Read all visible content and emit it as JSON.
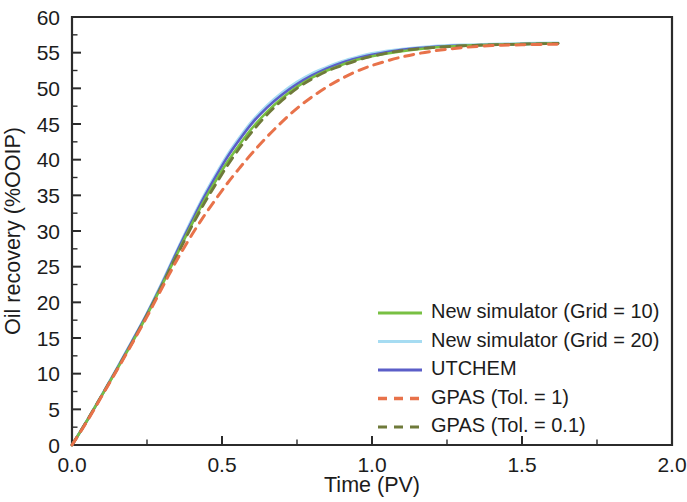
{
  "chart_data": {
    "type": "line",
    "title": "",
    "xlabel": "Time (PV)",
    "ylabel": "Oil recovery (%OOIP)",
    "xlim": [
      0.0,
      2.0
    ],
    "ylim": [
      0,
      60
    ],
    "xticks": [
      "0.0",
      "0.5",
      "1.0",
      "1.5",
      "2.0"
    ],
    "xtick_values": [
      0.0,
      0.5,
      1.0,
      1.5,
      2.0
    ],
    "xminor_step": 0.25,
    "yticks": [
      "0",
      "5",
      "10",
      "15",
      "20",
      "25",
      "30",
      "35",
      "40",
      "45",
      "50",
      "55",
      "60"
    ],
    "ytick_values": [
      0,
      5,
      10,
      15,
      20,
      25,
      30,
      35,
      40,
      45,
      50,
      55,
      60
    ],
    "yminor_step": 2.5,
    "grid": false,
    "legend_position": "lower right inside",
    "series": [
      {
        "name": "New simulator (Grid = 10)",
        "color": "#78c043",
        "style": "solid",
        "width": 2.6,
        "x": [
          0.0,
          0.05,
          0.1,
          0.15,
          0.2,
          0.25,
          0.3,
          0.33,
          0.36,
          0.4,
          0.44,
          0.48,
          0.52,
          0.56,
          0.6,
          0.65,
          0.7,
          0.75,
          0.8,
          0.85,
          0.9,
          0.95,
          1.0,
          1.1,
          1.2,
          1.3,
          1.4,
          1.5,
          1.62
        ],
        "y": [
          0.0,
          3.4,
          7.0,
          10.6,
          14.3,
          18.2,
          22.4,
          25.0,
          27.6,
          31.0,
          34.2,
          37.1,
          39.8,
          42.2,
          44.4,
          46.7,
          48.6,
          50.2,
          51.5,
          52.5,
          53.3,
          54.0,
          54.5,
          55.2,
          55.7,
          55.95,
          56.1,
          56.2,
          56.3
        ]
      },
      {
        "name": "New simulator (Grid = 20)",
        "color": "#a6dcf2",
        "style": "solid",
        "width": 2.6,
        "x": [
          0.0,
          0.05,
          0.1,
          0.15,
          0.2,
          0.25,
          0.3,
          0.33,
          0.36,
          0.4,
          0.44,
          0.48,
          0.52,
          0.56,
          0.6,
          0.65,
          0.7,
          0.75,
          0.8,
          0.85,
          0.9,
          0.95,
          1.0,
          1.1,
          1.2,
          1.3,
          1.4,
          1.5,
          1.62
        ],
        "y": [
          0.0,
          3.45,
          7.1,
          10.8,
          14.6,
          18.5,
          22.8,
          25.5,
          28.2,
          31.7,
          35.0,
          38.0,
          40.8,
          43.2,
          45.4,
          47.6,
          49.4,
          50.9,
          52.1,
          53.0,
          53.8,
          54.4,
          54.9,
          55.5,
          55.9,
          56.1,
          56.2,
          56.3,
          56.4
        ]
      },
      {
        "name": "UTCHEM",
        "color": "#5b5ec8",
        "style": "solid",
        "width": 2.6,
        "x": [
          0.0,
          0.05,
          0.1,
          0.15,
          0.2,
          0.25,
          0.3,
          0.33,
          0.36,
          0.4,
          0.44,
          0.48,
          0.52,
          0.56,
          0.6,
          0.65,
          0.7,
          0.75,
          0.8,
          0.85,
          0.9,
          0.95,
          1.0,
          1.1,
          1.2,
          1.3,
          1.4,
          1.5,
          1.62
        ],
        "y": [
          0.0,
          3.4,
          7.0,
          10.7,
          14.5,
          18.4,
          22.6,
          25.3,
          28.0,
          31.4,
          34.7,
          37.7,
          40.5,
          42.9,
          45.1,
          47.3,
          49.1,
          50.6,
          51.8,
          52.8,
          53.6,
          54.2,
          54.7,
          55.4,
          55.8,
          56.0,
          56.1,
          56.2,
          56.3
        ]
      },
      {
        "name": "GPAS (Tol. = 1)",
        "color": "#e8724a",
        "style": "dashed",
        "width": 3.0,
        "x": [
          0.0,
          0.05,
          0.1,
          0.15,
          0.2,
          0.25,
          0.3,
          0.33,
          0.36,
          0.4,
          0.44,
          0.48,
          0.52,
          0.56,
          0.6,
          0.65,
          0.7,
          0.75,
          0.8,
          0.85,
          0.9,
          0.95,
          1.0,
          1.1,
          1.2,
          1.3,
          1.4,
          1.5,
          1.62
        ],
        "y": [
          0.0,
          3.3,
          6.9,
          10.5,
          14.2,
          18.0,
          22.0,
          24.4,
          26.7,
          29.5,
          32.1,
          34.5,
          36.8,
          38.9,
          40.9,
          43.2,
          45.3,
          47.2,
          48.8,
          50.2,
          51.4,
          52.4,
          53.2,
          54.4,
          55.2,
          55.7,
          56.0,
          56.1,
          56.2
        ]
      },
      {
        "name": "GPAS (Tol. = 0.1)",
        "color": "#6f7a3a",
        "style": "dashed",
        "width": 2.8,
        "x": [
          0.0,
          0.05,
          0.1,
          0.15,
          0.2,
          0.25,
          0.3,
          0.33,
          0.36,
          0.4,
          0.44,
          0.48,
          0.52,
          0.56,
          0.6,
          0.65,
          0.7,
          0.75,
          0.8,
          0.85,
          0.9,
          0.95,
          1.0,
          1.1,
          1.2,
          1.3,
          1.4,
          1.5,
          1.62
        ],
        "y": [
          0.0,
          3.4,
          7.0,
          10.6,
          14.3,
          18.2,
          22.3,
          24.9,
          27.4,
          30.7,
          33.8,
          36.6,
          39.3,
          41.7,
          43.9,
          46.3,
          48.3,
          50.0,
          51.3,
          52.4,
          53.2,
          53.9,
          54.5,
          55.3,
          55.7,
          55.95,
          56.1,
          56.2,
          56.3
        ]
      }
    ]
  },
  "legend": {
    "items": [
      {
        "label": "New simulator (Grid = 10)"
      },
      {
        "label": "New simulator (Grid = 20)"
      },
      {
        "label": "UTCHEM"
      },
      {
        "label": "GPAS (Tol. = 1)"
      },
      {
        "label": "GPAS (Tol. = 0.1)"
      }
    ]
  }
}
